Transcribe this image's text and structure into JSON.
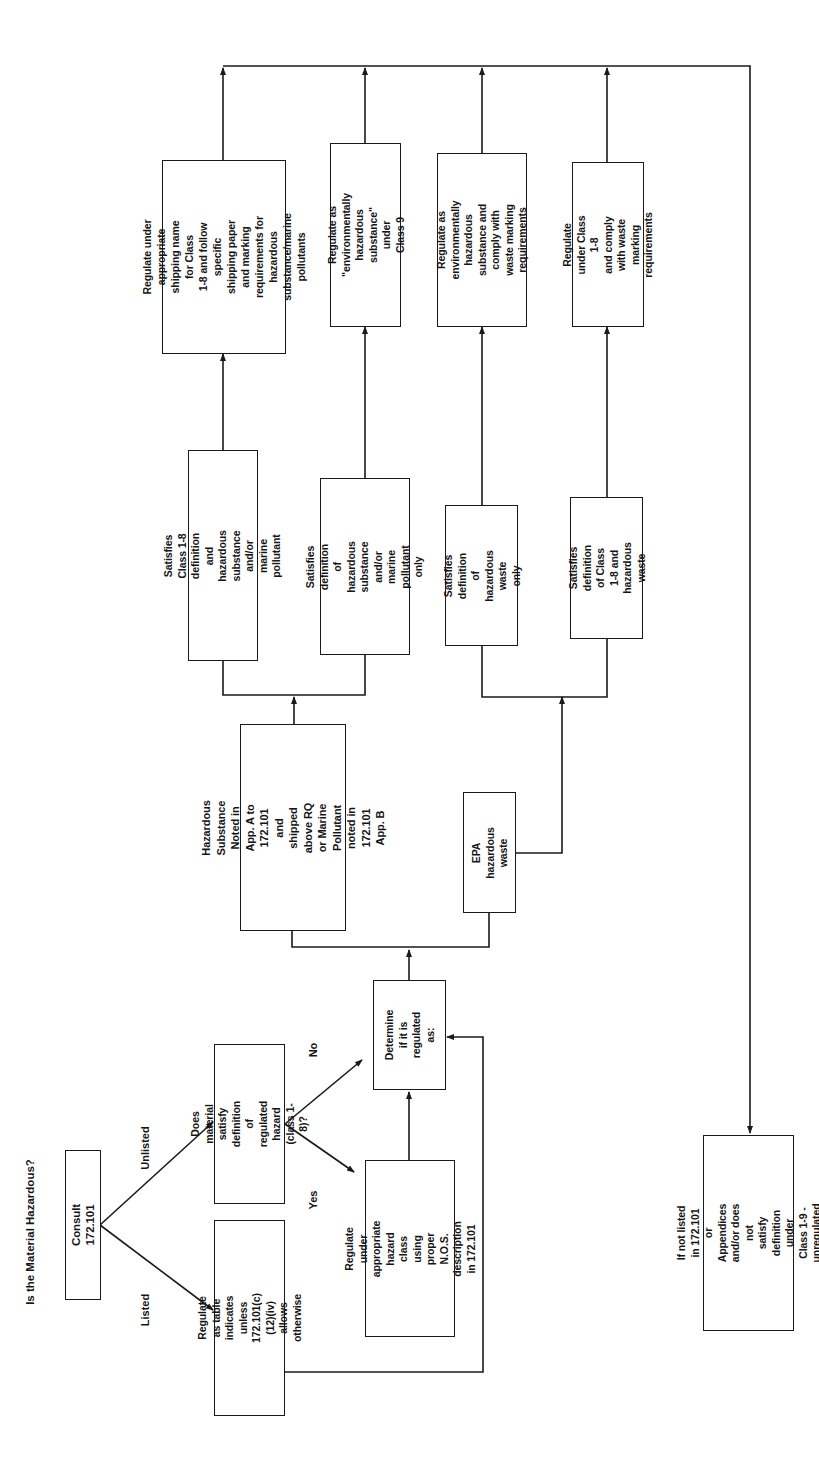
{
  "title": "Is the Material Hazardous?",
  "orientation": "rotated 90° counter-clockwise",
  "edge_labels": {
    "listed": "Listed",
    "unlisted": "Unlisted",
    "yes": "Yes",
    "no": "No"
  },
  "nodes": {
    "consult": "Consult 172.101",
    "listed_action": "Regulate as table indicates\nunless 172.101(c)(12)(iv)\nallows otherwise",
    "unlisted_question": "Does material satisfy\ndefinition of regulated\nhazard (class 1-8)?",
    "nos_action": "Regulate under\nappropriate hazard class\nusing proper N.O.S.\ndescription in 172.101",
    "determine": "Determine\nif it is\nregulated as:",
    "hazardous_substance": "Hazardous Substance\nNoted in App. A to\n172.101 and shipped\nabove RQ or Marine Pollutant\nnoted in 172.101 App. B",
    "epa_waste": "EPA hazardous\nwaste",
    "sat_class_and_hs": "Satisfies Class 1-8 definition\nand hazardous substance\nand/or marine pollutant",
    "sat_hs_only": "Satisfies definition of\nhazardous substance\nand/or marine pollutant\nonly",
    "sat_hw_only": "Satisfies definition\nof hazardous waste\nonly",
    "sat_class_and_hw": "Satisfies definition\nof Class 1-8 and\nhazardous waste",
    "reg_class_and_hs": "Regulate under appropriate\nshipping name for Class\n1-8 and follow specific\nshipping paper and marking\nrequirements for hazardous\nsubstance/marine pollutants",
    "reg_class9": "Regulate as \"environmentally\nhazardous substance\" under\nClass 9",
    "reg_env_waste": "Regulate as environmentally\nhazardous substance and\ncomply with waste marking\nrequirements",
    "reg_class_waste": "Regulate under Class 1-8\nand comply with waste\nmarking requirements",
    "unregulated": "If not listed in 172.101 or\nAppendices and/or does not\nsatisfy definition under\nClass 1-9 - unregulated"
  },
  "colors": {
    "line": "#1a1a1a",
    "background": "#ffffff"
  }
}
